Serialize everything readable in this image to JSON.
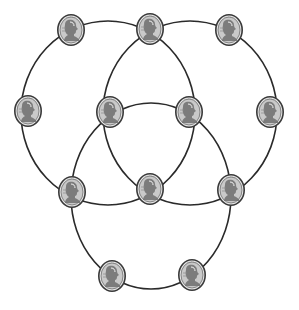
{
  "diagram": {
    "background_color": "#ffffff",
    "line_color": "#2a2a2a",
    "coin_colors": {
      "rim": "#3a3a3a",
      "field": "#c9c9c9",
      "relief": "#6e6e6e",
      "highlight": "#f2f2f2"
    },
    "circles": [
      {
        "id": "circle-top-left",
        "cx": 108,
        "cy": 113,
        "rx": 87,
        "ry": 92
      },
      {
        "id": "circle-top-right",
        "cx": 190,
        "cy": 113,
        "rx": 87,
        "ry": 92
      },
      {
        "id": "circle-bottom",
        "cx": 151,
        "cy": 196,
        "rx": 80,
        "ry": 93
      }
    ],
    "coins": [
      {
        "id": "coin-top-left",
        "type": "penny",
        "x": 71,
        "y": 30
      },
      {
        "id": "coin-top-middle",
        "type": "penny",
        "x": 150,
        "y": 29
      },
      {
        "id": "coin-top-right",
        "type": "penny",
        "x": 229,
        "y": 30
      },
      {
        "id": "coin-middle-far-left",
        "type": "penny",
        "x": 28,
        "y": 111
      },
      {
        "id": "coin-middle-inner-left",
        "type": "penny",
        "x": 110,
        "y": 112
      },
      {
        "id": "coin-middle-inner-right",
        "type": "penny",
        "x": 189,
        "y": 112
      },
      {
        "id": "coin-middle-far-right",
        "type": "penny",
        "x": 270,
        "y": 112
      },
      {
        "id": "coin-lower-left",
        "type": "penny",
        "x": 72,
        "y": 192
      },
      {
        "id": "coin-lower-center",
        "type": "penny",
        "x": 150,
        "y": 189
      },
      {
        "id": "coin-lower-right",
        "type": "penny",
        "x": 231,
        "y": 190
      },
      {
        "id": "coin-bottom-left",
        "type": "penny",
        "x": 112,
        "y": 276
      },
      {
        "id": "coin-bottom-right",
        "type": "penny",
        "x": 192,
        "y": 275
      }
    ],
    "coin_size": {
      "rx": 14,
      "ry": 16
    },
    "coin_count": 12,
    "circle_count": 3
  }
}
